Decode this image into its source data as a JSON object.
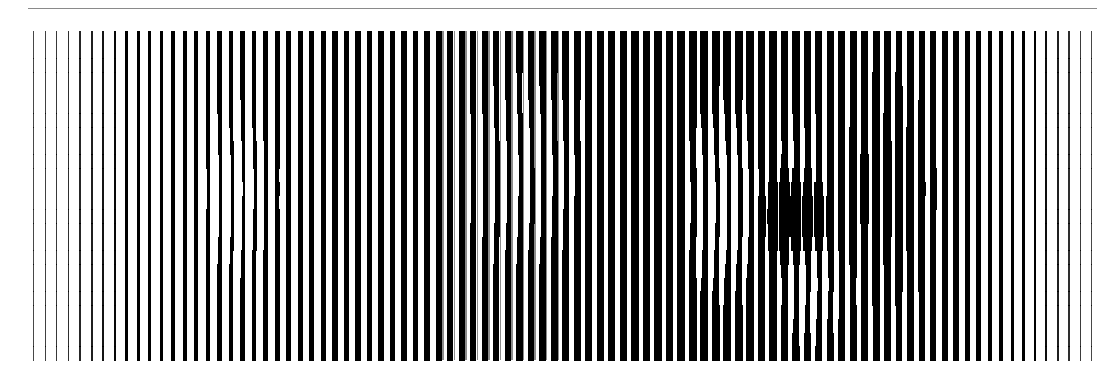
{
  "artwork": {
    "background": "#ffffff",
    "line_color": "#000000",
    "rule": {
      "x": 28,
      "y": 8,
      "width": 1069,
      "color": "#8a8a8a"
    },
    "field": {
      "top": 31,
      "bottom": 360
    },
    "pitch": 11.5,
    "start_x": 33,
    "widths": [
      1,
      1.2,
      1.4,
      1.6,
      1.8,
      2,
      2.2,
      2.5,
      2.8,
      3,
      3.3,
      3.6,
      3.8,
      4,
      4.2,
      4.4,
      4.6,
      4.6,
      4.8,
      4.8,
      5,
      5,
      5.2,
      5.2,
      5.4,
      5.4,
      5.5,
      5.5,
      5.6,
      5.6,
      5.6,
      5.6,
      5.8,
      5.8,
      6,
      6,
      6,
      6.2,
      6.2,
      6.4,
      6.4,
      6.6,
      6.6,
      6.8,
      6.8,
      7,
      7,
      7,
      7.2,
      7.2,
      7.4,
      7.4,
      7.6,
      7.6,
      7.8,
      7.8,
      8,
      8,
      8,
      8,
      8,
      8,
      8,
      7.8,
      7.8,
      7.6,
      7.6,
      7.4,
      7.4,
      7.2,
      7.2,
      7,
      7,
      7,
      6.8,
      6.8,
      6.6,
      6.4,
      6.2,
      6,
      5.6,
      5.2,
      4.8,
      4.4,
      4,
      3.6,
      3.2,
      2.8,
      2.4,
      2,
      1.6,
      1.3,
      1
    ],
    "highlights": [
      {
        "cx": 235,
        "cy": 190,
        "rx": 40,
        "ry": 100,
        "strength": 0.55
      },
      {
        "cx": 520,
        "cy": 170,
        "rx": 70,
        "ry": 110,
        "strength": 0.5
      },
      {
        "cx": 720,
        "cy": 200,
        "rx": 45,
        "ry": 110,
        "strength": 0.75
      },
      {
        "cx": 810,
        "cy": 290,
        "rx": 40,
        "ry": 60,
        "strength": 0.55
      },
      {
        "cx": 800,
        "cy": 150,
        "rx": 30,
        "ry": 45,
        "strength": 0.35
      }
    ],
    "shadows": [
      {
        "cx": 790,
        "cy": 215,
        "rx": 40,
        "ry": 50,
        "strength": 0.9
      },
      {
        "cx": 890,
        "cy": 190,
        "rx": 50,
        "ry": 120,
        "strength": 0.35
      }
    ]
  }
}
